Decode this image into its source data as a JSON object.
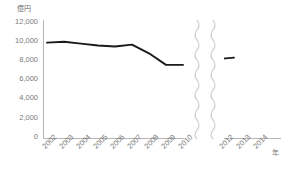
{
  "chart_data": {
    "type": "line",
    "title": "",
    "subtitle": "",
    "unit_label": "億円",
    "xlabel": "年",
    "ylabel": "",
    "ylim": [
      0,
      12000
    ],
    "ytick_values": [
      12000,
      10000,
      8000,
      6000,
      4000,
      2000,
      0
    ],
    "ytick_labels": [
      "12,000",
      "10,000",
      "8,000",
      "6,000",
      "4,000",
      "2,000",
      "0"
    ],
    "grid": false,
    "legend": null,
    "axis_break": {
      "present": true,
      "style": "wavy-vertical-double",
      "between": [
        "2010",
        "2012"
      ],
      "color": "#cccccc"
    },
    "categories": [
      "2002",
      "2003",
      "2004",
      "2005",
      "2006",
      "2007",
      "2008",
      "2009",
      "2010",
      "2012",
      "2013",
      "2014"
    ],
    "series": [
      {
        "name": "金額",
        "color": "#1a1a1a",
        "values": [
          9900,
          10000,
          9800,
          9600,
          9500,
          9700,
          8800,
          7600,
          7600,
          7650,
          8200,
          8350
        ]
      }
    ],
    "segments": [
      {
        "categories": [
          "2002",
          "2003",
          "2004",
          "2005",
          "2006",
          "2007",
          "2008",
          "2009",
          "2010"
        ],
        "values": [
          9900,
          10000,
          9800,
          9600,
          9500,
          9700,
          8800,
          7600,
          7600
        ]
      },
      {
        "categories": [
          "2012",
          "2013",
          "2014"
        ],
        "values": [
          7650,
          8200,
          8350
        ]
      }
    ]
  },
  "axes": {
    "y_axis_color": "#b5b5b5",
    "x_axis_color": "#b5b5b5",
    "tick_text_color": "#7a7a7a"
  }
}
